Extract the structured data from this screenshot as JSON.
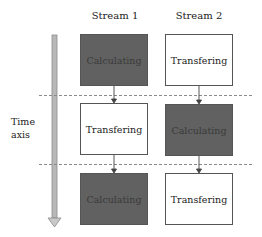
{
  "streams": [
    {
      "label": "Stream 1",
      "steps": [
        {
          "label": "Calculating",
          "kind": "calculating"
        },
        {
          "label": "Transfering",
          "kind": "transfering"
        },
        {
          "label": "Calculating",
          "kind": "calculating"
        }
      ]
    },
    {
      "label": "Stream 2",
      "steps": [
        {
          "label": "Transfering",
          "kind": "transfering"
        },
        {
          "label": "Calculating",
          "kind": "calculating"
        },
        {
          "label": "Transfering",
          "kind": "transfering"
        }
      ]
    }
  ],
  "time_axis": {
    "line1": "Time",
    "line2": "axis"
  },
  "colors": {
    "calculating": "#616161",
    "transfering": "#ffffff",
    "axis": "#b5b5b5",
    "dash": "#8a8a8a"
  }
}
